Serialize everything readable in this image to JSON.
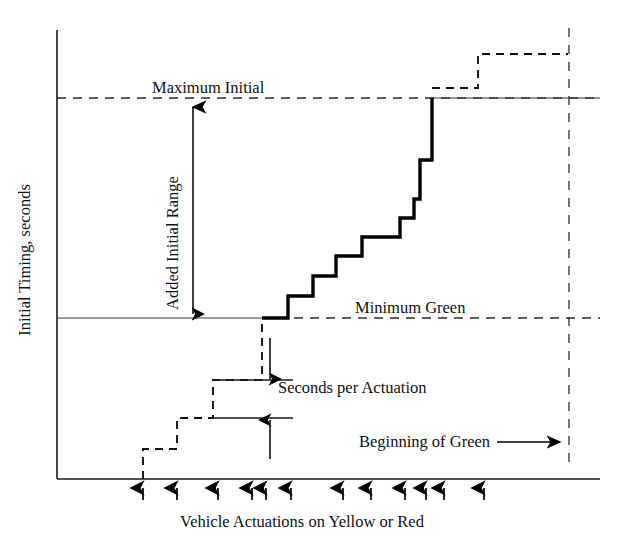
{
  "figure": {
    "background_color": "#ffffff",
    "line_color": "#000000"
  },
  "axes": {
    "y_label": "Initial Timing, seconds",
    "x_label": "Vehicle Actuations on Yellow or Red",
    "x_axis_y": 479,
    "y_axis_x": 57,
    "y_axis_top": 30,
    "x_axis_right": 600
  },
  "reference_lines": [
    {
      "name": "maximum-initial",
      "label": "Maximum Initial",
      "y": 98,
      "label_x": 152,
      "label_y": 93,
      "dashed_from_x": 57,
      "dashed_to_x": 600,
      "solid_from_x": 432,
      "solid_to_x": 600
    },
    {
      "name": "minimum-green",
      "label": "Minimum Green",
      "y": 318,
      "label_x": 355,
      "label_y": 313,
      "dashed_from_x": 262,
      "dashed_to_x": 600,
      "solid_from_x": 57,
      "solid_to_x": 262
    }
  ],
  "beginning_of_green": {
    "label": "Beginning of Green",
    "label_x": 359,
    "label_y": 447,
    "arrow_from_x": 497,
    "arrow_to_x": 563,
    "arrow_y": 442,
    "vertical_line_x": 569,
    "vertical_top_y": 28,
    "vertical_bottom_y": 465
  },
  "added_initial_range": {
    "label": "Added Initial Range",
    "arrow_x": 193,
    "arrow_top_y": 105,
    "arrow_bottom_y": 316,
    "label_x": 178,
    "label_y": 310
  },
  "seconds_per_actuation": {
    "label": "Seconds per Actuation",
    "label_x": 278,
    "label_y": 393,
    "upper_line": {
      "x1": 213,
      "x2": 293,
      "y": 380
    },
    "lower_line": {
      "x1": 213,
      "x2": 293,
      "y": 418
    },
    "down_arrow": {
      "x": 270,
      "y1": 338,
      "y2": 377
    },
    "up_arrow": {
      "x": 270,
      "y1": 459,
      "y2": 421
    }
  },
  "chart_data": {
    "type": "line",
    "xlabel": "Vehicle Actuations on Yellow or Red",
    "ylabel": "Initial Timing, seconds",
    "grid": false,
    "legend": "none",
    "series": [
      {
        "name": "added-initial-below-minimum-green",
        "style": "dashed",
        "description": "Hypothetical accumulation of seconds per actuation before reaching Minimum Green",
        "points": [
          [
            143,
            479
          ],
          [
            143,
            449
          ],
          [
            177,
            449
          ],
          [
            177,
            418
          ],
          [
            213,
            418
          ],
          [
            213,
            380
          ],
          [
            262,
            380
          ],
          [
            262,
            318
          ]
        ]
      },
      {
        "name": "initial-timing-step-function",
        "style": "solid",
        "description": "Effective initial timing accumulating from Minimum Green up to Maximum Initial",
        "points": [
          [
            262,
            318
          ],
          [
            288,
            318
          ],
          [
            288,
            296
          ],
          [
            313,
            296
          ],
          [
            313,
            276
          ],
          [
            336,
            276
          ],
          [
            336,
            256
          ],
          [
            362,
            256
          ],
          [
            362,
            237
          ],
          [
            400,
            237
          ],
          [
            400,
            218
          ],
          [
            414,
            218
          ],
          [
            414,
            199
          ],
          [
            420,
            199
          ],
          [
            420,
            160
          ],
          [
            432,
            160
          ],
          [
            432,
            98
          ]
        ]
      },
      {
        "name": "added-initial-above-maximum-initial",
        "style": "dashed",
        "description": "Hypothetical accumulation that would exceed the Maximum Initial cap",
        "points": [
          [
            432,
            88
          ],
          [
            478,
            88
          ],
          [
            478,
            54
          ],
          [
            568,
            54
          ]
        ]
      }
    ],
    "actuation_ticks": {
      "label": "Vehicle Actuations on Yellow or Red",
      "marker": "up-arrow",
      "y_base": 500,
      "y_tip": 483,
      "x_positions": [
        143,
        177,
        218,
        252,
        266,
        291,
        343,
        371,
        405,
        426,
        444,
        484
      ]
    },
    "annotations": [
      {
        "text": "Maximum Initial",
        "at_y": 98
      },
      {
        "text": "Minimum Green",
        "at_y": 318
      },
      {
        "text": "Added Initial Range",
        "span_y": [
          98,
          318
        ]
      },
      {
        "text": "Seconds per Actuation",
        "span_y": [
          380,
          418
        ]
      },
      {
        "text": "Beginning of Green",
        "at_x": 569
      }
    ]
  }
}
